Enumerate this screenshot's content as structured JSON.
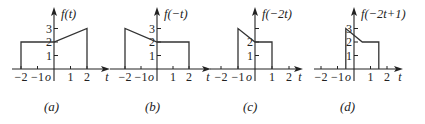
{
  "chart_data": [
    {
      "type": "line",
      "id": "a",
      "title": "f(t)",
      "caption": "(a)",
      "xlabel": "t",
      "origin_label": "o",
      "x_ticks": [
        -2,
        -1,
        1,
        2
      ],
      "x_tick_labels": [
        "-2",
        "-1",
        "1",
        "2"
      ],
      "y_ticks": [
        1,
        2,
        3
      ],
      "y_tick_labels": [
        "1",
        "2",
        "3"
      ],
      "xlim": [
        -2.5,
        2.8
      ],
      "ylim": [
        0,
        3.4
      ],
      "points": [
        [
          -2,
          0
        ],
        [
          -2,
          2
        ],
        [
          0,
          2
        ],
        [
          2,
          3
        ],
        [
          2,
          0
        ]
      ]
    },
    {
      "type": "line",
      "id": "b",
      "title": "f(−t)",
      "caption": "(b)",
      "xlabel": "t",
      "origin_label": "o",
      "x_ticks": [
        -2,
        -1,
        1,
        2
      ],
      "x_tick_labels": [
        "-2",
        "-1",
        "1",
        "2"
      ],
      "y_ticks": [
        1,
        2,
        3
      ],
      "y_tick_labels": [
        "1",
        "2",
        "3"
      ],
      "xlim": [
        -2.5,
        2.8
      ],
      "ylim": [
        0,
        3.4
      ],
      "points": [
        [
          -2,
          0
        ],
        [
          -2,
          3
        ],
        [
          0,
          2
        ],
        [
          2,
          2
        ],
        [
          2,
          0
        ]
      ]
    },
    {
      "type": "line",
      "id": "c",
      "title": "f(−2t)",
      "caption": "(c)",
      "xlabel": "t",
      "origin_label": "o",
      "x_ticks": [
        -2,
        -1,
        1,
        2
      ],
      "x_tick_labels": [
        "-2",
        "-1",
        "1",
        "2"
      ],
      "y_ticks": [
        1,
        2,
        3
      ],
      "y_tick_labels": [
        "1",
        "2",
        ""
      ],
      "xlim": [
        -2.5,
        2.8
      ],
      "ylim": [
        0,
        3.4
      ],
      "points": [
        [
          -1,
          0
        ],
        [
          -1,
          3
        ],
        [
          0,
          2
        ],
        [
          1,
          2
        ],
        [
          1,
          0
        ]
      ]
    },
    {
      "type": "line",
      "id": "d",
      "title": "f(−2t+1)",
      "caption": "(d)",
      "xlabel": "t",
      "origin_label": "o",
      "x_ticks": [
        -2,
        -1,
        1,
        2
      ],
      "x_tick_labels": [
        "-2",
        "-1",
        "1",
        "2"
      ],
      "y_ticks": [
        1,
        2,
        3
      ],
      "y_tick_labels": [
        "1",
        "2",
        "3"
      ],
      "xlim": [
        -2.5,
        2.8
      ],
      "ylim": [
        0,
        3.4
      ],
      "points": [
        [
          -0.5,
          0
        ],
        [
          -0.5,
          3
        ],
        [
          0.5,
          2
        ],
        [
          1.5,
          2
        ],
        [
          1.5,
          0
        ]
      ]
    }
  ]
}
